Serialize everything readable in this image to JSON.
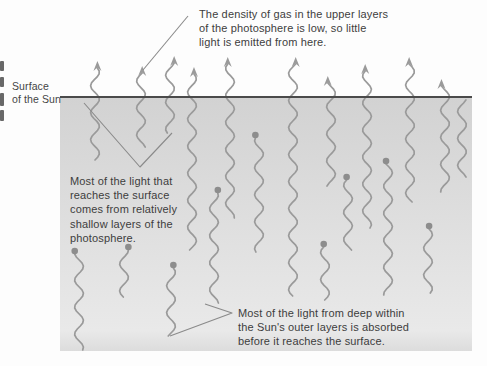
{
  "figure": {
    "width": 487,
    "height": 366,
    "colors": {
      "region_top": "#d2d2d2",
      "region_mid": "#e0e0e0",
      "region_bottom": "#e9e9e9",
      "surface_line": "#4a4a4a",
      "ray": "#9a9a9a",
      "dot": "#8d8d8d",
      "leader": "#8a8a8a",
      "text": "#3d3d3d"
    },
    "region": {
      "x": 60,
      "y": 97,
      "width": 412,
      "height": 254
    },
    "surface_y": 97,
    "escaping_rays": [
      {
        "x": 95,
        "tip_y": 62,
        "bottom_y": 160
      },
      {
        "x": 141,
        "tip_y": 67,
        "bottom_y": 147
      },
      {
        "x": 170,
        "tip_y": 57,
        "bottom_y": 133
      },
      {
        "x": 192,
        "tip_y": 68,
        "bottom_y": 250
      },
      {
        "x": 230,
        "tip_y": 58,
        "bottom_y": 218
      },
      {
        "x": 293,
        "tip_y": 58,
        "bottom_y": 296
      },
      {
        "x": 331,
        "tip_y": 77,
        "bottom_y": 186
      },
      {
        "x": 367,
        "tip_y": 65,
        "bottom_y": 228
      },
      {
        "x": 410,
        "tip_y": 58,
        "bottom_y": 202
      },
      {
        "x": 445,
        "tip_y": 80,
        "bottom_y": 192
      }
    ],
    "absorbed_rays": [
      {
        "x": 79,
        "dot_y": 251,
        "bottom_y": 350
      },
      {
        "x": 124,
        "dot_y": 247,
        "bottom_y": 297
      },
      {
        "x": 171,
        "dot_y": 265,
        "bottom_y": 336
      },
      {
        "x": 214,
        "dot_y": 190,
        "bottom_y": 303
      },
      {
        "x": 259,
        "dot_y": 135,
        "bottom_y": 252
      },
      {
        "x": 325,
        "dot_y": 244,
        "bottom_y": 300
      },
      {
        "x": 348,
        "dot_y": 177,
        "bottom_y": 250
      },
      {
        "x": 388,
        "dot_y": 161,
        "bottom_y": 295
      },
      {
        "x": 428,
        "dot_y": 226,
        "bottom_y": 293
      }
    ],
    "plain_waves": [
      {
        "x": 462,
        "top_y": 100,
        "bottom_y": 177
      }
    ],
    "leader_lines": [
      {
        "points": [
          [
            188,
            16
          ],
          [
            143,
            70
          ]
        ]
      },
      {
        "points": [
          [
            84,
            103
          ],
          [
            140,
            167
          ],
          [
            172,
            133
          ]
        ]
      },
      {
        "points": [
          [
            205,
            304
          ],
          [
            232,
            313
          ],
          [
            170,
            336
          ]
        ]
      }
    ]
  },
  "labels": {
    "surface": {
      "lines": [
        "Surface",
        "of the Sun"
      ]
    },
    "top_annotation": {
      "lines": [
        "The density of gas in the upper layers",
        "of the photosphere is low, so little",
        "light is emitted from here."
      ]
    },
    "middle_annotation": {
      "lines": [
        "Most of the light that",
        "reaches the surface",
        "comes from relatively",
        "shallow layers of the",
        "photosphere."
      ]
    },
    "bottom_annotation": {
      "lines": [
        "Most of the light from deep within",
        "the Sun's outer layers is absorbed",
        "before it reaches the surface."
      ]
    }
  }
}
